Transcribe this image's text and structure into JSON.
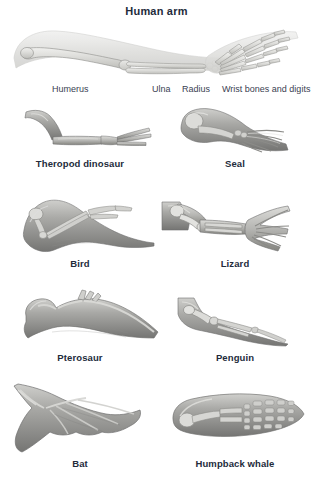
{
  "figure": {
    "title": "Human arm",
    "part_labels": [
      {
        "id": "humerus",
        "text": "Humerus",
        "x": 52,
        "y": 84
      },
      {
        "id": "ulna",
        "text": "Ulna",
        "x": 152,
        "y": 84
      },
      {
        "id": "radius",
        "text": "Radius",
        "x": 182,
        "y": 84
      },
      {
        "id": "wrist",
        "text": "Wrist bones and digits",
        "x": 222,
        "y": 84
      }
    ],
    "specimens": [
      {
        "id": "theropod-dinosaur",
        "caption": "Theropod dinosaur",
        "row": 1,
        "col": "left"
      },
      {
        "id": "seal",
        "caption": "Seal",
        "row": 1,
        "col": "right"
      },
      {
        "id": "bird",
        "caption": "Bird",
        "row": 2,
        "col": "left"
      },
      {
        "id": "lizard",
        "caption": "Lizard",
        "row": 2,
        "col": "right"
      },
      {
        "id": "pterosaur",
        "caption": "Pterosaur",
        "row": 3,
        "col": "left"
      },
      {
        "id": "penguin",
        "caption": "Penguin",
        "row": 3,
        "col": "right"
      },
      {
        "id": "bat",
        "caption": "Bat",
        "row": 4,
        "col": "left"
      },
      {
        "id": "humpback-whale",
        "caption": "Humpback whale",
        "row": 4,
        "col": "right"
      }
    ],
    "colors": {
      "background": "#ffffff",
      "text": "#232b3b",
      "label_text": "#3a4152",
      "bone_light": "#e8e8e6",
      "bone_mid": "#c9c9c6",
      "limb_dark": "#8f8f8d",
      "limb_mid": "#b4b4b1",
      "outline": "#6f6f6e"
    }
  }
}
